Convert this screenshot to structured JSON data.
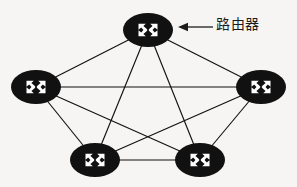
{
  "figure": {
    "kind": "network-topology-diagram",
    "topology": "full-mesh",
    "background_color": "#f6f5f3",
    "node_color": "#111111",
    "node_glyph_color": "#ffffff",
    "link_color": "#111111"
  },
  "annotation": {
    "label": "路由器",
    "arrow_direction": "left",
    "points_to_node": "router-top"
  },
  "nodes": [
    {
      "id": "router-top",
      "name": "router-top",
      "cx": 148,
      "cy": 30,
      "rx": 25,
      "ry": 17,
      "icon": "router-icon"
    },
    {
      "id": "router-left",
      "name": "router-left",
      "cx": 36,
      "cy": 87,
      "rx": 25,
      "ry": 17,
      "icon": "router-icon"
    },
    {
      "id": "router-right",
      "name": "router-right",
      "cx": 261,
      "cy": 87,
      "rx": 25,
      "ry": 17,
      "icon": "router-icon"
    },
    {
      "id": "router-bottom-left",
      "name": "router-bottom-left",
      "cx": 95,
      "cy": 160,
      "rx": 25,
      "ry": 17,
      "icon": "router-icon"
    },
    {
      "id": "router-bottom-right",
      "name": "router-bottom-right",
      "cx": 200,
      "cy": 160,
      "rx": 25,
      "ry": 17,
      "icon": "router-icon"
    }
  ],
  "links": [
    {
      "from": "router-top",
      "to": "router-left",
      "x1": 148,
      "y1": 30,
      "x2": 36,
      "y2": 87
    },
    {
      "from": "router-top",
      "to": "router-right",
      "x1": 148,
      "y1": 30,
      "x2": 261,
      "y2": 87
    },
    {
      "from": "router-top",
      "to": "router-bottom-left",
      "x1": 148,
      "y1": 30,
      "x2": 95,
      "y2": 160
    },
    {
      "from": "router-top",
      "to": "router-bottom-right",
      "x1": 148,
      "y1": 30,
      "x2": 200,
      "y2": 160
    },
    {
      "from": "router-left",
      "to": "router-right",
      "x1": 36,
      "y1": 87,
      "x2": 261,
      "y2": 87
    },
    {
      "from": "router-left",
      "to": "router-bottom-left",
      "x1": 36,
      "y1": 87,
      "x2": 95,
      "y2": 160
    },
    {
      "from": "router-left",
      "to": "router-bottom-right",
      "x1": 36,
      "y1": 87,
      "x2": 200,
      "y2": 160
    },
    {
      "from": "router-right",
      "to": "router-bottom-left",
      "x1": 261,
      "y1": 87,
      "x2": 95,
      "y2": 160
    },
    {
      "from": "router-right",
      "to": "router-bottom-right",
      "x1": 261,
      "y1": 87,
      "x2": 200,
      "y2": 160
    },
    {
      "from": "router-bottom-left",
      "to": "router-bottom-right",
      "x1": 95,
      "y1": 160,
      "x2": 200,
      "y2": 160
    }
  ],
  "arrow": {
    "tip_x": 178,
    "tip_y": 27,
    "tail_x": 213,
    "tail_y": 27
  }
}
